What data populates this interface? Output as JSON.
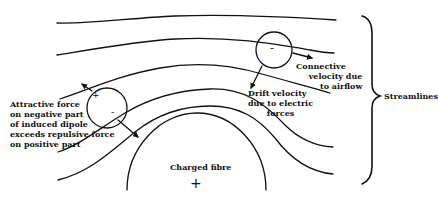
{
  "diagram": {
    "type": "streamlines-around-charged-fibre",
    "labels": {
      "attractive_force": [
        "Attractive force",
        "on negative part",
        "of induced dipole",
        "exceeds repulsive force",
        "on positive part"
      ],
      "convective_velocity": [
        "Connective",
        "velocity due",
        "to airflow"
      ],
      "drift_velocity": [
        "Drift velocity",
        "due to electric",
        "forces"
      ],
      "charged_fibre": "Charged fibre",
      "streamlines": "Streamlines"
    },
    "signs": {
      "fibre_charge": "+",
      "particle_left_plus": "+",
      "particle_left_minus": "-",
      "particle_right_minus": "-"
    },
    "colors": {
      "line": "#111111",
      "background": "#ffffff"
    }
  }
}
